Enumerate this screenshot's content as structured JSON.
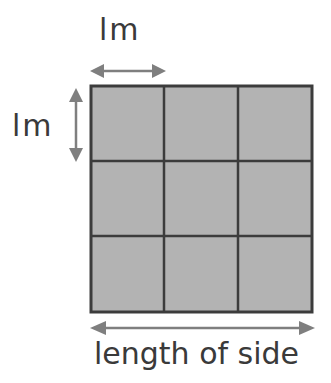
{
  "diagram": {
    "top_label": "lm",
    "left_label": "lm",
    "bottom_label": "length of side",
    "grid": {
      "rows": 3,
      "cols": 3
    },
    "colors": {
      "fill": "#b3b3b3",
      "line": "#3c3c3c",
      "arrow": "#7f7f7f",
      "text": "#3a3a3a"
    }
  }
}
